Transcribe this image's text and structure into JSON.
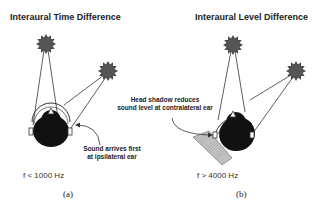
{
  "panels": [
    {
      "id": "a",
      "title": "Interaural Time Difference",
      "annotation_line1": "Sound arrives first",
      "annotation_line2": "at ipsilateral ear",
      "frequency": "f < 1000 Hz",
      "caption": "(a)"
    },
    {
      "id": "b",
      "title": "Interaural Level Difference",
      "annotation_line1": "Head shadow reduces",
      "annotation_line2": "sound level at contralateral ear",
      "frequency": "f > 4000 Hz",
      "caption": "(b)"
    }
  ],
  "colors": {
    "source_fill": "#555555",
    "head_fill": "#111111",
    "line": "#333333",
    "shadow_fill": "#aaaaaa"
  }
}
